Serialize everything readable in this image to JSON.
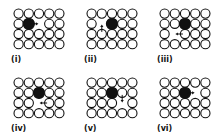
{
  "figure": {
    "grid": {
      "cols": 5,
      "rows": 4
    },
    "colors": {
      "atom_outline": "#111111",
      "atom_fill": "#ffffff",
      "solute_fill": "#111111",
      "arrow": "#111111"
    },
    "panels": [
      {
        "label": "(i)",
        "solute": [
          1,
          1
        ],
        "vacancy": [
          1,
          2
        ],
        "arrow": {
          "from": [
            1,
            1
          ],
          "dir": "right"
        }
      },
      {
        "label": "(ii)",
        "solute": [
          1,
          2
        ],
        "vacancy": [
          1,
          1
        ],
        "arrow": {
          "from": [
            2,
            1
          ],
          "dir": "up"
        }
      },
      {
        "label": "(iii)",
        "solute": [
          1,
          2
        ],
        "vacancy": [
          2,
          1
        ],
        "arrow": {
          "from": [
            2,
            2
          ],
          "dir": "left"
        }
      },
      {
        "label": "(iv)",
        "solute": [
          1,
          2
        ],
        "vacancy": [
          2,
          2
        ],
        "arrow": {
          "from": [
            2,
            3
          ],
          "dir": "left"
        }
      },
      {
        "label": "(v)",
        "solute": [
          1,
          2
        ],
        "vacancy": [
          2,
          3
        ],
        "arrow": {
          "from": [
            1,
            3
          ],
          "dir": "down"
        }
      },
      {
        "label": "(vi)",
        "solute": [
          1,
          2
        ],
        "vacancy": [
          1,
          3
        ],
        "arrow": {
          "from": [
            1,
            2
          ],
          "dir": "right"
        }
      }
    ]
  }
}
